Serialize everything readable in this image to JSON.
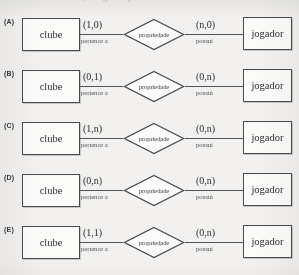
{
  "page": {
    "background_color": "#f2f1ef",
    "ink_color": "#3a3a3a",
    "cut_off_top_text": "caso relacionamento, a seguir representados:"
  },
  "diagram": {
    "left_entity": "clube",
    "right_entity": "jogador",
    "relationship": "propriedade",
    "left_verb": "pertence a",
    "right_verb": "possui"
  },
  "rows": [
    {
      "label": "(A)",
      "left_entity": "clube",
      "left_cardinality": "(1,0)",
      "left_verb": "pertence a",
      "relationship": "propriedade",
      "right_cardinality": "(n,0)",
      "right_verb": "possui",
      "right_entity": "jogador"
    },
    {
      "label": "(B)",
      "left_entity": "clube",
      "left_cardinality": "(0,1)",
      "left_verb": "pertence a",
      "relationship": "propriedade",
      "right_cardinality": "(0,n)",
      "right_verb": "possui",
      "right_entity": "jogador"
    },
    {
      "label": "(C)",
      "left_entity": "clube",
      "left_cardinality": "(1,n)",
      "left_verb": "pertence a",
      "relationship": "propriedade",
      "right_cardinality": "(0,n)",
      "right_verb": "possui",
      "right_entity": "jogador"
    },
    {
      "label": "(D)",
      "left_entity": "clube",
      "left_cardinality": "(0,n)",
      "left_verb": "pertence a",
      "relationship": "propriedade",
      "right_cardinality": "(0,n)",
      "right_verb": "possui",
      "right_entity": "jogador"
    },
    {
      "label": "(E)",
      "left_entity": "clube",
      "left_cardinality": "(1,1)",
      "left_verb": "pertence a",
      "relationship": "propriedade",
      "right_cardinality": "(0,n)",
      "right_verb": "possui",
      "right_entity": "jogador"
    }
  ]
}
